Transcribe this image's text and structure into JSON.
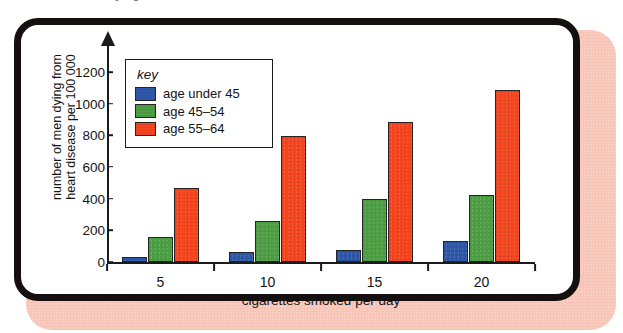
{
  "figure": {
    "frame_border_color": "#15100f",
    "shadow_color": "#f6c3b4",
    "top_sliver_ghost_text": "number of men dying from heart disease"
  },
  "legend": {
    "title": "key",
    "entries": [
      {
        "label": "age under 45",
        "color": "#2e57a8"
      },
      {
        "label": "age 45–54",
        "color": "#4d9e44"
      },
      {
        "label": "age 55–64",
        "color": "#f4451f"
      }
    ]
  },
  "axes": {
    "y_ticks": [
      "0",
      "200",
      "400",
      "600",
      "800",
      "1000",
      "1200"
    ],
    "x_ticks": [
      "5",
      "10",
      "15",
      "20"
    ],
    "y_title_line1": "number of men dying from",
    "y_title_line2": "heart disease per 100 000",
    "x_title": "cigarettes smoked per day"
  },
  "chart_data": {
    "type": "bar",
    "title": "",
    "categories": [
      "5",
      "10",
      "15",
      "20"
    ],
    "series": [
      {
        "name": "age under 45",
        "color": "#2e57a8",
        "values": [
          30,
          65,
          75,
          132
        ]
      },
      {
        "name": "age 45–54",
        "color": "#4d9e44",
        "values": [
          160,
          255,
          400,
          422
        ]
      },
      {
        "name": "age 55–64",
        "color": "#f4451f",
        "values": [
          465,
          795,
          883,
          1088
        ]
      }
    ],
    "xlabel": "cigarettes smoked per day",
    "ylabel": "number of men dying from heart disease per 100 000",
    "ylim": [
      0,
      1200
    ],
    "ytick_step": 200,
    "grid": false,
    "legend_position": "upper-left-inside",
    "legend_title": "key"
  }
}
